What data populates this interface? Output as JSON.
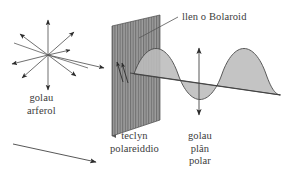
{
  "figure": {
    "language": "cy",
    "background_color": "#ffffff",
    "ink_color": "#3b3b3b",
    "plate_fill_color": "#9a9a9a",
    "wave_fill_color": "#b9b9b9"
  },
  "labels": {
    "polaroid_sheet": "llen o Bolaroid",
    "normal_light_line1": "golau",
    "normal_light_line2": "arferol",
    "polarising_device_line1": "teclyn",
    "polarising_device_line2": "polareiddio",
    "plane_polarised_line1": "golau",
    "plane_polarised_line2": "plân",
    "plane_polarised_line3": "polar"
  },
  "icons": {
    "unpolarised_star": "radiating-arrows-icon",
    "incoming_ray": "right-arrow-icon",
    "direction_ray": "diagonal-arrow-icon",
    "vibration_axis": "double-headed-vertical-arrow-icon",
    "plate_vibration_marks": "diagonal-arrow-icon",
    "leader_line": "leader-line-icon",
    "polariser_plate": "striped-plate-icon",
    "sine_wave": "sine-wave-icon"
  },
  "geometry": {
    "star_center_x": 48,
    "star_center_y": 55,
    "plate_top_left_x": 112,
    "plate_top_left_y": 26,
    "wave_axis_left_x": 130,
    "wave_axis_right_x": 278,
    "wave_amplitude": 28,
    "wave_cycles": 2
  }
}
